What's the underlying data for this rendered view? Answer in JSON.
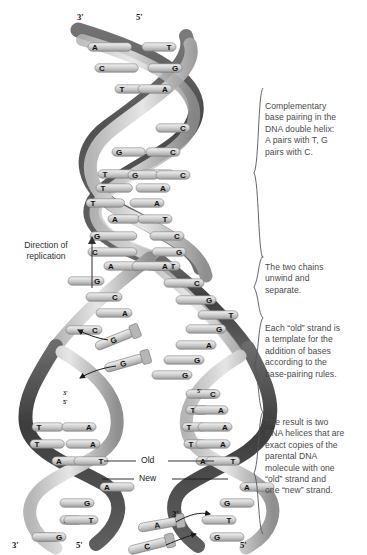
{
  "figure": {
    "background": "#ffffff",
    "ink": "#4a4a4a",
    "strand_dark": "#4d4d4d",
    "strand_light": "#c9c9c9",
    "rung_fill": "#d8d8d8",
    "rung_stroke": "#6e6e6e"
  },
  "left_caption": {
    "line1": "Direction of",
    "line2": "replication",
    "arrow": "up-arrow-icon"
  },
  "strand_labels": {
    "old": "Old",
    "new": "New"
  },
  "prime_labels": {
    "top_left": "3'",
    "top_right": "5'",
    "fork_left_upper": "3'",
    "fork_left_lower": "5'",
    "fork_right": "5'",
    "bottom_left_left": "3'",
    "bottom_left_right": "5'",
    "bottom_right_left": "3'",
    "bottom_right_right": "5'"
  },
  "annotations": [
    {
      "id": "annot-complementary-pairing",
      "text": "Complementary\nbase pairing in the\nDNA double helix:\nA pairs with T, G\npairs with C.",
      "bracket_top": 88,
      "bracket_bottom": 258
    },
    {
      "id": "annot-unwind",
      "text": "The two chains\nunwind and\nseparate.",
      "bracket_top": 256,
      "bracket_bottom": 318
    },
    {
      "id": "annot-template",
      "text": "Each “old” strand is\na template for the\naddition of bases\naccording to the\nbase-pairing rules.",
      "bracket_top": 318,
      "bracket_bottom": 412
    },
    {
      "id": "annot-result",
      "text": "The result is two\nDNA helices that are\nexact copies of the\nparental DNA\nmolecule with one\n“old” strand and\none “new” strand.",
      "bracket_top": 412,
      "bracket_bottom": 534
    }
  ],
  "base_pairs": {
    "parent_helix": [
      {
        "y": 47,
        "left": "A",
        "right": "T",
        "x1": 88,
        "x2": 172
      },
      {
        "y": 68,
        "left": "C",
        "right": "G",
        "x1": 95,
        "x2": 178
      },
      {
        "y": 89,
        "left": "T",
        "right": "A",
        "x1": 115,
        "x2": 168
      },
      {
        "y": 128,
        "left": "",
        "right": "C",
        "x1": 150,
        "x2": 186
      },
      {
        "y": 152,
        "left": "G",
        "right": "C",
        "x1": 112,
        "x2": 176
      },
      {
        "y": 174,
        "left": "T",
        "right": "A",
        "x1": 98,
        "x2": 170
      },
      {
        "y": 175,
        "left": "G",
        "right": "C",
        "x1": 128,
        "x2": 186
      },
      {
        "y": 188,
        "left": "T",
        "right": "A",
        "x1": 96,
        "x2": 166
      },
      {
        "y": 203,
        "left": "T",
        "right": "A",
        "x1": 86,
        "x2": 160
      },
      {
        "y": 219,
        "left": "A",
        "right": "T",
        "x1": 108,
        "x2": 168
      },
      {
        "y": 236,
        "left": "G",
        "right": "C",
        "x1": 90,
        "x2": 180
      },
      {
        "y": 252,
        "left": "C",
        "right": "G",
        "x1": 88,
        "x2": 182
      },
      {
        "y": 266,
        "left": "A",
        "right": "T",
        "x1": 104,
        "x2": 176
      }
    ],
    "separated_left_strand": [
      {
        "y": 281,
        "base": "G",
        "x": 68
      },
      {
        "y": 297,
        "base": "C",
        "x": 86
      },
      {
        "y": 313,
        "base": "A",
        "x": 96
      },
      {
        "y": 330,
        "base": "C",
        "x": 66
      }
    ],
    "separated_right_strand": [
      {
        "y": 266,
        "base": "A",
        "x": 168
      },
      {
        "y": 283,
        "base": "C",
        "x": 200
      },
      {
        "y": 300,
        "base": "G",
        "x": 212
      },
      {
        "y": 315,
        "base": "T",
        "x": 234
      },
      {
        "y": 329,
        "base": "G",
        "x": 222
      },
      {
        "y": 345,
        "base": "A",
        "x": 212
      },
      {
        "y": 360,
        "base": "G",
        "x": 200
      },
      {
        "y": 375,
        "base": "G",
        "x": 188
      }
    ],
    "free_nucleotides_middle": [
      {
        "base": "G",
        "x": 118,
        "y": 338,
        "angle": -22
      },
      {
        "base": "G",
        "x": 128,
        "y": 362,
        "angle": -16
      }
    ],
    "free_nucleotides_bottom": [
      {
        "base": "A",
        "x": 162,
        "y": 524,
        "angle": -10
      },
      {
        "base": "C",
        "x": 152,
        "y": 545,
        "angle": -14
      }
    ],
    "daughter_left": [
      {
        "y": 427,
        "left": "T",
        "right": "A",
        "x1": 32,
        "x2": 92
      },
      {
        "y": 444,
        "left": "T",
        "right": "A",
        "x1": 30,
        "x2": 96
      },
      {
        "y": 461,
        "left": "A",
        "right": "T",
        "x1": 52,
        "x2": 104
      },
      {
        "y": 487,
        "left": "A",
        "right": "",
        "x1": 100,
        "x2": 0
      },
      {
        "y": 503,
        "left": "",
        "right": "G",
        "x1": 0,
        "x2": 90
      },
      {
        "y": 520,
        "left": "A",
        "right": "T",
        "x1": 60,
        "x2": 94
      },
      {
        "y": 537,
        "left": "C",
        "right": "G",
        "x1": 36,
        "x2": 62
      }
    ],
    "daughter_right": [
      {
        "y": 394,
        "left": "G",
        "right": "C",
        "x1": 196,
        "x2": 216
      },
      {
        "y": 410,
        "left": "T",
        "right": "A",
        "x1": 186,
        "x2": 224
      },
      {
        "y": 427,
        "left": "T",
        "right": "A",
        "x1": 182,
        "x2": 228
      },
      {
        "y": 444,
        "left": "T",
        "right": "A",
        "x1": 184,
        "x2": 226
      },
      {
        "y": 461,
        "left": "A",
        "right": "T",
        "x1": 196,
        "x2": 236
      },
      {
        "y": 487,
        "left": "A",
        "right": "",
        "x1": 240,
        "x2": 0
      },
      {
        "y": 503,
        "left": "G",
        "right": "",
        "x1": 220,
        "x2": 0
      },
      {
        "y": 520,
        "left": "",
        "right": "T",
        "x1": 0,
        "x2": 232
      },
      {
        "y": 537,
        "left": "G",
        "right": "",
        "x1": 210,
        "x2": 0
      }
    ]
  }
}
